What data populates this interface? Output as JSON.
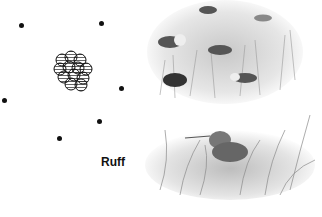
{
  "diagram": {
    "label": "Ruff",
    "males_dots": [
      {
        "x": 19,
        "y": 23
      },
      {
        "x": 99,
        "y": 21
      },
      {
        "x": 2,
        "y": 98
      },
      {
        "x": 119,
        "y": 86
      },
      {
        "x": 97,
        "y": 119
      },
      {
        "x": 57,
        "y": 136
      }
    ],
    "cluster": {
      "description": "cluster of hatched circles (lek territories)",
      "count": 12
    },
    "illustrations": [
      {
        "name": "ruffs-displaying-in-grass",
        "description": "group of ruff birds in grassland"
      },
      {
        "name": "ruff-in-tall-grass",
        "description": "single ruff nesting in tall grass"
      }
    ]
  }
}
